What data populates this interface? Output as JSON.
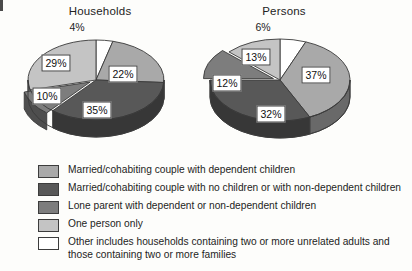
{
  "page": {
    "background": "#fdfdfb"
  },
  "palette": {
    "married_dependent": "#a9a9a9",
    "married_no_children": "#585858",
    "lone_parent": "#7d7d7d",
    "one_person": "#c4c4c4",
    "other": "#ffffff",
    "outline": "#3a3a3a",
    "side_shade_factor": "darker"
  },
  "charts": [
    {
      "id": "households",
      "title": "Households",
      "callout": "4%"
    },
    {
      "id": "persons",
      "title": "Persons",
      "callout": "6%"
    }
  ],
  "legend": {
    "items": [
      {
        "key": "married_dependent",
        "color": "#a9a9a9",
        "label": "Married/cohabiting couple with dependent children"
      },
      {
        "key": "married_no_children",
        "color": "#585858",
        "label": "Married/cohabiting couple with no children or with non-dependent children"
      },
      {
        "key": "lone_parent",
        "color": "#7d7d7d",
        "label": "Lone parent with dependent or non-dependent children"
      },
      {
        "key": "one_person",
        "color": "#c4c4c4",
        "label": "One person only"
      },
      {
        "key": "other",
        "color": "#ffffff",
        "label": "Other includes households containing two or more unrelated adults and those containing two or more families"
      }
    ]
  },
  "chart_data": [
    {
      "type": "pie",
      "title": "Households",
      "xlabel": "",
      "ylabel": "",
      "unit": "percent",
      "three_d": true,
      "exploded_slice": "Lone parent with dependent or non-dependent children",
      "categories": [
        "Other includes households containing two or more unrelated adults and those containing two or more families",
        "Married/cohabiting couple with dependent children",
        "Married/cohabiting couple with no children or with non-dependent children",
        "Lone parent with dependent or non-dependent children",
        "One person only"
      ],
      "values": [
        4,
        22,
        35,
        10,
        29
      ],
      "labels": [
        "4%",
        "22%",
        "35%",
        "10%",
        "29%"
      ],
      "colors": [
        "#ffffff",
        "#a9a9a9",
        "#585858",
        "#7d7d7d",
        "#c4c4c4"
      ],
      "legend_position": "bottom"
    },
    {
      "type": "pie",
      "title": "Persons",
      "xlabel": "",
      "ylabel": "",
      "unit": "percent",
      "three_d": true,
      "exploded_slice": "Lone parent with dependent or non-dependent children",
      "categories": [
        "Other includes households containing two or more unrelated adults and those containing two or more families",
        "Married/cohabiting couple with dependent children",
        "Married/cohabiting couple with no children or with non-dependent children",
        "Lone parent with dependent or non-dependent children",
        "One person only"
      ],
      "values": [
        6,
        37,
        32,
        12,
        13
      ],
      "labels": [
        "6%",
        "37%",
        "32%",
        "12%",
        "13%"
      ],
      "colors": [
        "#ffffff",
        "#a9a9a9",
        "#585858",
        "#7d7d7d",
        "#c4c4c4"
      ],
      "legend_position": "bottom"
    }
  ]
}
